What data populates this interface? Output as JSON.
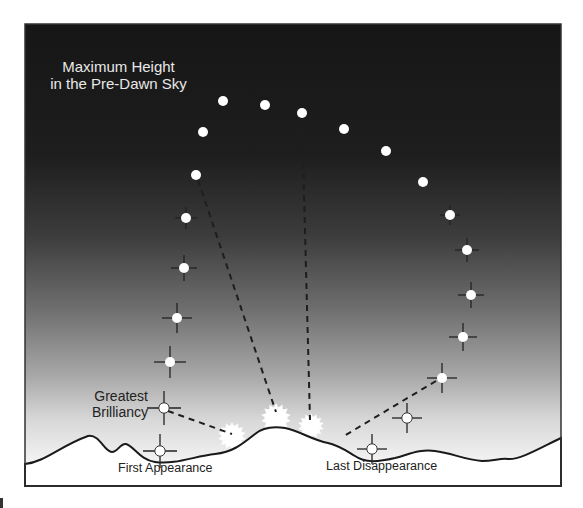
{
  "diagram": {
    "title_line1": "Maximum Height",
    "title_line2": "in the Pre-Dawn Sky",
    "label_greatest_line1": "Greatest",
    "label_greatest_line2": "Brilliancy",
    "label_first": "First Appearance",
    "label_last": "Last Disappearance",
    "colors": {
      "sky_top": "#1a1a1a",
      "sky_mid": "#555555",
      "sky_horizon": "#f2f2f2",
      "ground": "#ffffff",
      "frame": "#333333",
      "planet_fill": "#ffffff",
      "dash": "#222222"
    },
    "frame": {
      "x": 25,
      "y": 24,
      "w": 536,
      "h": 462
    },
    "planets": [
      {
        "x": 160,
        "y": 451,
        "cross": 12
      },
      {
        "x": 164,
        "y": 408,
        "cross": 12
      },
      {
        "x": 170,
        "y": 362,
        "cross": 11
      },
      {
        "x": 177,
        "y": 318,
        "cross": 10
      },
      {
        "x": 184,
        "y": 268,
        "cross": 8
      },
      {
        "x": 186,
        "y": 218,
        "cross": 6
      },
      {
        "x": 196,
        "y": 175,
        "cross": 0
      },
      {
        "x": 203,
        "y": 132,
        "cross": 0
      },
      {
        "x": 223,
        "y": 101,
        "cross": 0
      },
      {
        "x": 265,
        "y": 105,
        "cross": 0
      },
      {
        "x": 302,
        "y": 113,
        "cross": 0
      },
      {
        "x": 344,
        "y": 129,
        "cross": 0
      },
      {
        "x": 386,
        "y": 151,
        "cross": 0
      },
      {
        "x": 423,
        "y": 182,
        "cross": 0
      },
      {
        "x": 450,
        "y": 215,
        "cross": 5
      },
      {
        "x": 467,
        "y": 250,
        "cross": 7
      },
      {
        "x": 471,
        "y": 295,
        "cross": 8
      },
      {
        "x": 463,
        "y": 337,
        "cross": 9
      },
      {
        "x": 442,
        "y": 378,
        "cross": 10
      },
      {
        "x": 407,
        "y": 418,
        "cross": 10
      },
      {
        "x": 372,
        "y": 449,
        "cross": 10
      }
    ],
    "dashed_lines": [
      {
        "x1": 168,
        "y1": 411,
        "x2": 232,
        "y2": 434
      },
      {
        "x1": 198,
        "y1": 180,
        "x2": 276,
        "y2": 412
      },
      {
        "x1": 302,
        "y1": 118,
        "x2": 310,
        "y2": 420
      },
      {
        "x1": 436,
        "y1": 381,
        "x2": 344,
        "y2": 436
      }
    ],
    "suns": [
      {
        "x": 232,
        "y": 436,
        "r": 14
      },
      {
        "x": 276,
        "y": 418,
        "r": 15
      },
      {
        "x": 311,
        "y": 426,
        "r": 13
      }
    ],
    "ground_path": "M25,464 C45,462 60,446 88,436 C100,434 104,452 112,452 C118,452 120,443 126,444 C134,446 140,460 155,462 C175,465 195,456 215,454 C232,452 240,446 255,434 C262,428 272,426 285,428 C300,431 312,440 328,443 C340,446 345,450 355,456 C365,463 378,462 395,458 C410,454 420,449 435,451 C452,453 465,460 482,461 C494,461 500,458 508,459 C520,460 540,448 561,438 L561,486 L25,486 Z"
  }
}
